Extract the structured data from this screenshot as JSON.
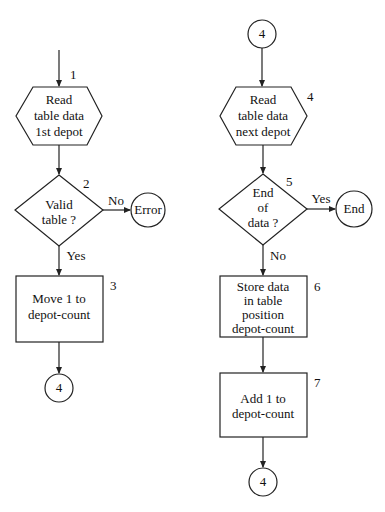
{
  "diagram": {
    "type": "flowchart",
    "left_flow": {
      "entry_step_number": "1",
      "read_first": {
        "number": "1",
        "lines": [
          "Read",
          "table data",
          "1st depot"
        ]
      },
      "valid_check": {
        "number": "2",
        "lines": [
          "Valid",
          "table ?"
        ],
        "no_label": "No",
        "yes_label": "Yes"
      },
      "error_terminal": {
        "label": "Error"
      },
      "move_one": {
        "number": "3",
        "lines": [
          "Move 1 to",
          "depot-count"
        ]
      },
      "connector_out": {
        "label": "4"
      }
    },
    "right_flow": {
      "connector_in": {
        "label": "4"
      },
      "read_next": {
        "number": "4",
        "lines": [
          "Read",
          "table data",
          "next depot"
        ]
      },
      "end_check": {
        "number": "5",
        "lines": [
          "End",
          "of",
          "data ?"
        ],
        "yes_label": "Yes",
        "no_label": "No"
      },
      "end_terminal": {
        "label": "End"
      },
      "store_data": {
        "number": "6",
        "lines": [
          "Store data",
          "in table",
          "position",
          "depot-count"
        ]
      },
      "add_one": {
        "number": "7",
        "lines": [
          "Add 1 to",
          "depot-count"
        ]
      },
      "connector_out": {
        "label": "4"
      }
    }
  }
}
